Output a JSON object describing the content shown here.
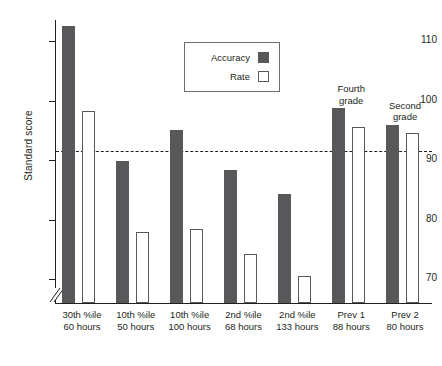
{
  "chart_data": {
    "type": "bar",
    "title": "",
    "xlabel": "",
    "ylabel": "Standard score",
    "ylim": [
      66,
      115
    ],
    "grid": false,
    "legend_position": "top-center",
    "y_ticks": [
      110,
      100,
      90,
      80,
      70
    ],
    "y_tick_labels": [
      "110",
      "100",
      "90",
      "80",
      "70"
    ],
    "axis_break": true,
    "reference_line": {
      "value": 91.5,
      "style": "dashed",
      "label": ""
    },
    "categories": [
      "30th %ile\n60 hours",
      "10th %ile\n50 hours",
      "10th %ile\n100 hours",
      "2nd %ile\n68 hours",
      "2nd %ile\n133 hours",
      "Prev 1\n88 hours",
      "Prev 2\n80 hours"
    ],
    "category_lines": [
      [
        "30th %ile",
        "60 hours"
      ],
      [
        "10th %ile",
        "50 hours"
      ],
      [
        "10th %ile",
        "100 hours"
      ],
      [
        "2nd %ile",
        "68 hours"
      ],
      [
        "2nd %ile",
        "133 hours"
      ],
      [
        "Prev 1",
        "88 hours"
      ],
      [
        "Prev 2",
        "80 hours"
      ]
    ],
    "series": [
      {
        "name": "Accuracy",
        "color": "#58585b",
        "values": [
          112.5,
          89.8,
          95.0,
          88.4,
          84.4,
          98.7,
          96.0
        ]
      },
      {
        "name": "Rate",
        "color": "#ffffff",
        "values": [
          98.3,
          78.0,
          78.5,
          74.3,
          70.5,
          95.6,
          94.5
        ]
      }
    ],
    "annotations": [
      {
        "text_lines": [
          "Fourth",
          "grade"
        ],
        "category_index": 5
      },
      {
        "text_lines": [
          "Second",
          "grade"
        ],
        "category_index": 6
      }
    ]
  },
  "legend": {
    "items": [
      {
        "label": "Accuracy",
        "swatch": "filled"
      },
      {
        "label": "Rate",
        "swatch": "outlined"
      }
    ]
  },
  "colors": {
    "accuracy": "#58585b",
    "rate": "#ffffff",
    "axis": "#231f20",
    "background": "#ffffff"
  }
}
